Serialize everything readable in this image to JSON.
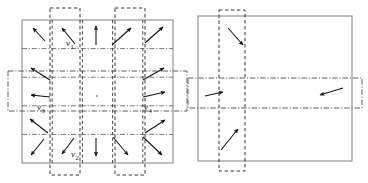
{
  "figure": {
    "domain_type": "vector-field-domain-decomposition",
    "background_color": "#ffffff",
    "ink_color": "#111111",
    "frame_color": "#8a8a8a",
    "dash_color": "#2b2b2b",
    "dashdot_color": "#555555",
    "width": 368,
    "height": 183,
    "panels": [
      {
        "id": "left-panel",
        "name": "fine-grid-vector-field-panel",
        "square": {
          "x": 22,
          "y": 20,
          "w": 151,
          "h": 143
        },
        "grid_columns": 5,
        "grid_rows": 5,
        "overlap_bands": {
          "vertical": [
            {
              "name": "vertical-band-left",
              "x": 50,
              "w": 30,
              "overhang_top": 12,
              "overhang_bottom": 12
            },
            {
              "name": "vertical-band-right",
              "x": 115,
              "w": 30,
              "overhang_top": 12,
              "overhang_bottom": 12
            }
          ],
          "horizontal": [
            {
              "name": "horizontal-band-middle",
              "y": 71,
              "h": 40,
              "overhang_left": 14,
              "overhang_right": 14
            }
          ]
        },
        "labels": [
          {
            "name": "label-v1",
            "text": "v",
            "sub": "1",
            "x": 66,
            "y": 46
          },
          {
            "name": "label-v2",
            "text": "v",
            "sub": "2",
            "x": 71,
            "y": 157
          },
          {
            "name": "label-v3",
            "text": "v",
            "sub": "3",
            "x": 37,
            "y": 110
          },
          {
            "name": "label-v4",
            "text": "v",
            "sub": "4",
            "x": 144,
            "y": 110
          }
        ],
        "arrows": [
          {
            "name": "arrow-r1c1",
            "x1": 45,
            "y1": 41,
            "x2": 33,
            "y2": 28
          },
          {
            "name": "arrow-r1c2",
            "x1": 75,
            "y1": 44,
            "x2": 62,
            "y2": 28
          },
          {
            "name": "arrow-r1c3",
            "x1": 96,
            "y1": 45,
            "x2": 96,
            "y2": 26
          },
          {
            "name": "arrow-r1c4",
            "x1": 112,
            "y1": 45,
            "x2": 131,
            "y2": 28
          },
          {
            "name": "arrow-r1c5",
            "x1": 145,
            "y1": 43,
            "x2": 163,
            "y2": 27
          },
          {
            "name": "arrow-r2c1",
            "x1": 50,
            "y1": 80,
            "x2": 31,
            "y2": 68
          },
          {
            "name": "arrow-r2c5",
            "x1": 143,
            "y1": 80,
            "x2": 164,
            "y2": 68
          },
          {
            "name": "arrow-r3c1",
            "x1": 50,
            "y1": 97,
            "x2": 31,
            "y2": 95
          },
          {
            "name": "arrow-r3c5",
            "x1": 143,
            "y1": 97,
            "x2": 165,
            "y2": 92
          },
          {
            "name": "arrow-r4c1",
            "x1": 48,
            "y1": 133,
            "x2": 30,
            "y2": 119
          },
          {
            "name": "arrow-r4c5",
            "x1": 145,
            "y1": 133,
            "x2": 165,
            "y2": 120
          },
          {
            "name": "arrow-r5c1",
            "x1": 44,
            "y1": 139,
            "x2": 31,
            "y2": 155
          },
          {
            "name": "arrow-r5c2",
            "x1": 74,
            "y1": 138,
            "x2": 62,
            "y2": 154
          },
          {
            "name": "arrow-r5c3",
            "x1": 96,
            "y1": 138,
            "x2": 96,
            "y2": 156
          },
          {
            "name": "arrow-r5c4",
            "x1": 113,
            "y1": 137,
            "x2": 128,
            "y2": 155
          },
          {
            "name": "arrow-r5c5",
            "x1": 143,
            "y1": 137,
            "x2": 162,
            "y2": 155
          }
        ],
        "center_dot": {
          "name": "center-dot",
          "x": 97,
          "y": 96
        }
      },
      {
        "id": "right-panel",
        "name": "coarse-grid-vector-field-panel",
        "square": {
          "x": 198,
          "y": 16,
          "w": 154,
          "h": 145
        },
        "overlap_bands": {
          "vertical": [
            {
              "name": "vertical-band-left",
              "x": 219,
              "w": 26,
              "overhang_top": 6,
              "overhang_bottom": 10
            }
          ],
          "horizontal": [
            {
              "name": "horizontal-band-middle",
              "y": 78,
              "h": 30,
              "overhang_left": 10,
              "overhang_right": 10
            }
          ]
        },
        "labels": [],
        "arrows": [
          {
            "name": "arrow-top-down-right",
            "x1": 228,
            "y1": 28,
            "x2": 243,
            "y2": 45
          },
          {
            "name": "arrow-left-right",
            "x1": 205,
            "y1": 96,
            "x2": 223,
            "y2": 92
          },
          {
            "name": "arrow-right-left",
            "x1": 343,
            "y1": 88,
            "x2": 320,
            "y2": 95
          },
          {
            "name": "arrow-bottom-up-right",
            "x1": 221,
            "y1": 150,
            "x2": 238,
            "y2": 129
          }
        ],
        "center_dot": null
      }
    ]
  }
}
